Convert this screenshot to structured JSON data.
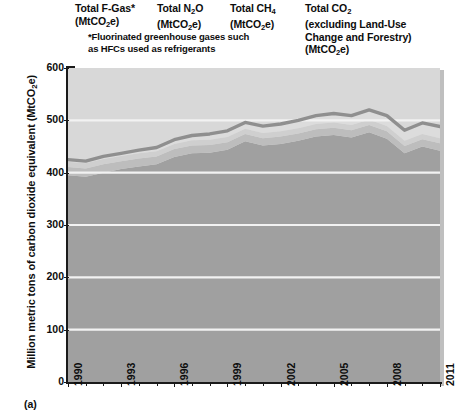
{
  "figure": {
    "panel_label": "(a)",
    "headers": [
      {
        "name": "fgas",
        "lines": [
          "Total F-Gas*",
          "(MtCO₂e)"
        ]
      },
      {
        "name": "n2o",
        "lines": [
          "Total N₂O",
          "(MtCO₂e)"
        ]
      },
      {
        "name": "ch4",
        "lines": [
          "Total CH₄",
          "(MtCO₂e)"
        ]
      },
      {
        "name": "co2",
        "lines": [
          "Total CO₂",
          "(excluding Land-Use",
          "Change and Forestry)",
          "(MtCO₂e)"
        ]
      }
    ],
    "footnote_lines": [
      "*Fluorinated greenhouse gases such",
      "as HFCs used as refrigerants"
    ]
  },
  "chart_data": {
    "type": "area",
    "stacked": true,
    "title": "",
    "xlabel": "",
    "ylabel": "Million metric tons of carbon dioxide equivalent (MtCO₂e)",
    "xlim": [
      1990,
      2011
    ],
    "ylim": [
      0,
      600
    ],
    "yticks": [
      0,
      100,
      200,
      300,
      400,
      500,
      600
    ],
    "ytick_labels": [
      "0",
      "100",
      "200",
      "300",
      "400",
      "500",
      "600"
    ],
    "xticks": [
      1990,
      1993,
      1996,
      1999,
      2002,
      2005,
      2008,
      2011
    ],
    "xtick_labels": [
      "1990",
      "1993",
      "1996",
      "1999",
      "2002",
      "2005",
      "2008",
      "2011"
    ],
    "xticks_minor": [
      1991,
      1992,
      1994,
      1995,
      1997,
      1998,
      2000,
      2001,
      2003,
      2004,
      2006,
      2007,
      2009,
      2010
    ],
    "grid": true,
    "grid_color": "#f2f2f2",
    "plot_background": "#d9d9d9",
    "x": [
      1990,
      1991,
      1992,
      1993,
      1994,
      1995,
      1996,
      1997,
      1998,
      1999,
      2000,
      2001,
      2002,
      2003,
      2004,
      2005,
      2006,
      2007,
      2008,
      2009,
      2010,
      2011
    ],
    "series": [
      {
        "name": "Total CO₂ (excluding Land-Use Change and Forestry)",
        "short": "co2",
        "color": "#a0a0a0",
        "values": [
          395,
          392,
          400,
          407,
          412,
          416,
          430,
          437,
          438,
          444,
          460,
          452,
          455,
          461,
          469,
          472,
          467,
          477,
          465,
          437,
          450,
          442
        ]
      },
      {
        "name": "Total CH₄",
        "short": "ch4",
        "color": "#bdbdbd",
        "values": [
          16,
          16,
          16,
          15,
          15,
          15,
          15,
          15,
          15,
          14,
          14,
          14,
          14,
          14,
          14,
          14,
          14,
          14,
          14,
          14,
          14,
          14
        ]
      },
      {
        "name": "Total N₂O",
        "short": "n2o",
        "color": "#cfcfcf",
        "values": [
          10,
          10,
          10,
          10,
          10,
          10,
          10,
          10,
          10,
          10,
          10,
          10,
          10,
          10,
          10,
          10,
          10,
          10,
          10,
          10,
          10,
          10
        ]
      },
      {
        "name": "Total F-Gas*",
        "short": "fgas",
        "color": "#dcdcdc",
        "values": [
          4,
          4,
          5,
          5,
          6,
          7,
          8,
          9,
          11,
          12,
          12,
          13,
          14,
          15,
          16,
          17,
          18,
          19,
          20,
          20,
          21,
          22
        ]
      }
    ],
    "total_line": {
      "name": "Total greenhouse gas emissions",
      "color": "#8f8f8f",
      "values": [
        425,
        422,
        431,
        437,
        443,
        448,
        463,
        471,
        474,
        480,
        496,
        489,
        493,
        500,
        509,
        513,
        509,
        520,
        509,
        481,
        495,
        488
      ]
    }
  }
}
